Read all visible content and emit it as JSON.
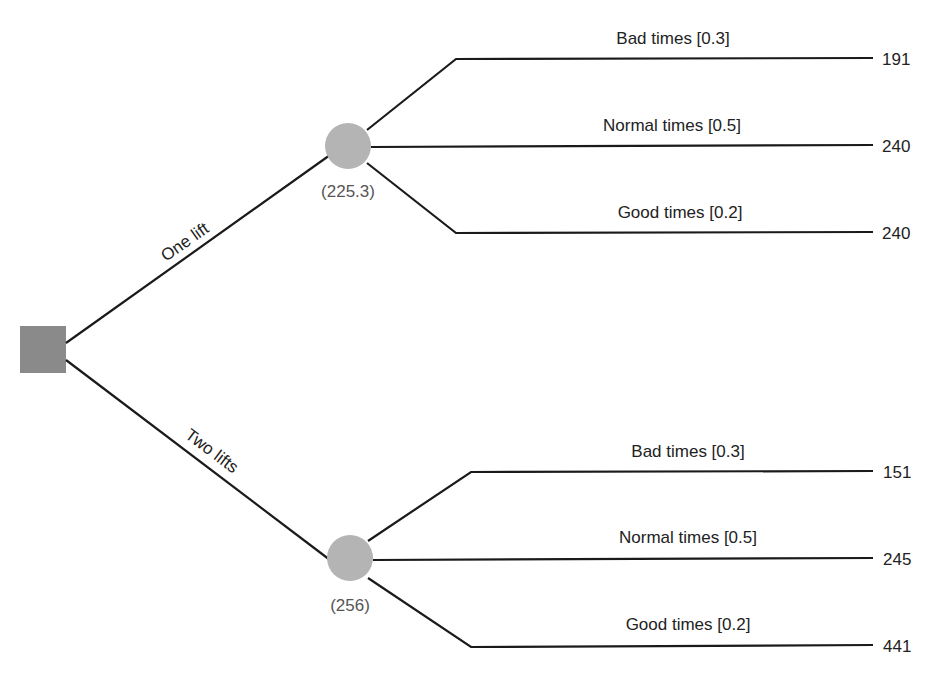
{
  "decision_node": {
    "shape": "square",
    "color": "#8a8a8a"
  },
  "options": [
    {
      "label": "One lift",
      "expected_value": "(225.3)",
      "chance_color": "#b4b4b4",
      "outcomes": [
        {
          "label": "Bad times [0.3]",
          "payoff": "191"
        },
        {
          "label": "Normal times [0.5]",
          "payoff": "240"
        },
        {
          "label": "Good times [0.2]",
          "payoff": "240"
        }
      ]
    },
    {
      "label": "Two lifts",
      "expected_value": "(256)",
      "chance_color": "#b4b4b4",
      "outcomes": [
        {
          "label": "Bad times [0.3]",
          "payoff": "151"
        },
        {
          "label": "Normal times [0.5]",
          "payoff": "245"
        },
        {
          "label": "Good times [0.2]",
          "payoff": "441"
        }
      ]
    }
  ]
}
